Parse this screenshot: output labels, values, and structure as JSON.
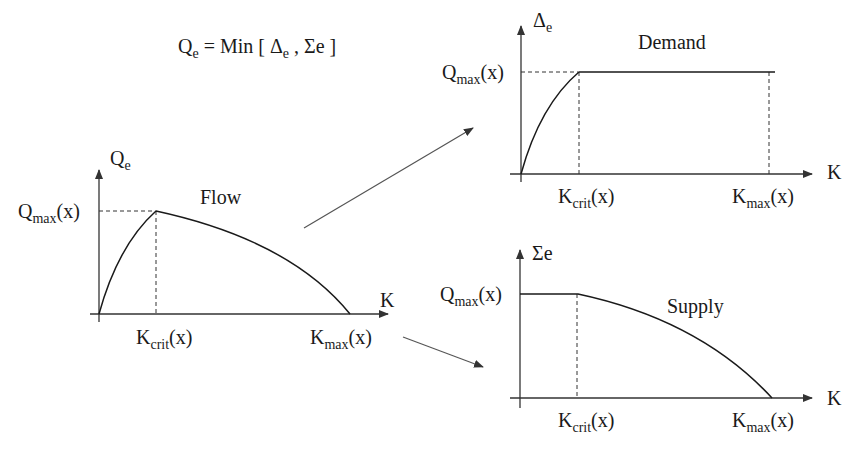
{
  "formula": {
    "lhs": "Q",
    "lhs_sub": "e",
    "eq": " = Min [ ",
    "delta": "Δ",
    "delta_sub": "e",
    "sep": " , ",
    "sigma": "Σe",
    "close": " ]"
  },
  "panels": {
    "flow": {
      "title": "Flow",
      "y_axis": {
        "symbol": "Q",
        "sub": "e"
      },
      "x_axis": "K",
      "y_tick": {
        "main": "Q",
        "sub": "max",
        "arg": "(x)"
      },
      "x_ticks": [
        {
          "main": "K",
          "sub": "crit",
          "arg": "(x)"
        },
        {
          "main": "K",
          "sub": "max",
          "arg": "(x)"
        }
      ]
    },
    "demand": {
      "title": "Demand",
      "y_axis": {
        "symbol": "Δ",
        "sub": "e"
      },
      "x_axis": "K",
      "y_tick": {
        "main": "Q",
        "sub": "max",
        "arg": "(x)"
      },
      "x_ticks": [
        {
          "main": "K",
          "sub": "crit",
          "arg": "(x)"
        },
        {
          "main": "K",
          "sub": "max",
          "arg": "(x)"
        }
      ]
    },
    "supply": {
      "title": "Supply",
      "y_axis": {
        "symbol": "Σe"
      },
      "x_axis": "K",
      "y_tick": {
        "main": "Q",
        "sub": "max",
        "arg": "(x)"
      },
      "x_ticks": [
        {
          "main": "K",
          "sub": "crit",
          "arg": "(x)"
        },
        {
          "main": "K",
          "sub": "max",
          "arg": "(x)"
        }
      ]
    }
  },
  "colors": {
    "line": "#1a1a1a",
    "arrow": "#555555",
    "dash": "#333333"
  }
}
